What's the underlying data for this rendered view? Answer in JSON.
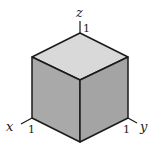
{
  "diagram": {
    "axes": {
      "x": {
        "label": "x",
        "tick": "1"
      },
      "y": {
        "label": "y",
        "tick": "1"
      },
      "z": {
        "label": "z",
        "tick": "1"
      }
    },
    "colors": {
      "top_face": "#d9d9d9",
      "left_face": "#a9a9a9",
      "right_face": "#a4a4a4",
      "edge": "#1a1a1a"
    }
  }
}
